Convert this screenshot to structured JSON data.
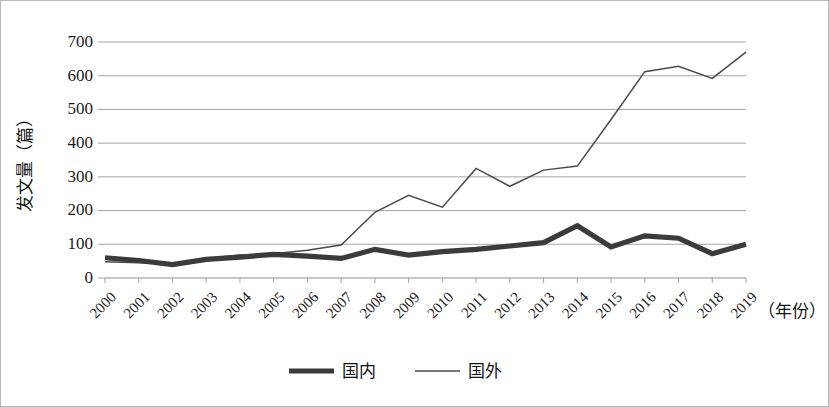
{
  "chart_data": {
    "type": "line",
    "title": "",
    "xlabel": "（年份）",
    "ylabel": "发文量（篇）",
    "ylim": [
      0,
      700
    ],
    "yticks": [
      0,
      100,
      200,
      300,
      400,
      500,
      600,
      700
    ],
    "ytick_labels": [
      "0",
      "100",
      "200",
      "300",
      "400",
      "500",
      "600",
      "700"
    ],
    "grid": true,
    "legend_position": "bottom-center",
    "categories": [
      "2000",
      "2001",
      "2002",
      "2003",
      "2004",
      "2005",
      "2006",
      "2007",
      "2008",
      "2009",
      "2010",
      "2011",
      "2012",
      "2013",
      "2014",
      "2015",
      "2016",
      "2017",
      "2018",
      "2019"
    ],
    "series": [
      {
        "name": "国内",
        "style": "thick",
        "color": "#3b3b3b",
        "values": [
          60,
          52,
          40,
          55,
          62,
          70,
          65,
          58,
          85,
          68,
          78,
          85,
          95,
          105,
          155,
          92,
          125,
          118,
          72,
          100
        ]
      },
      {
        "name": "国外",
        "style": "thin",
        "color": "#4a4a4a",
        "values": [
          48,
          45,
          42,
          58,
          68,
          72,
          82,
          98,
          195,
          245,
          210,
          325,
          272,
          320,
          332,
          470,
          612,
          628,
          592,
          670
        ]
      }
    ]
  },
  "legend": {
    "items": [
      {
        "label": "国内"
      },
      {
        "label": "国外"
      }
    ]
  }
}
